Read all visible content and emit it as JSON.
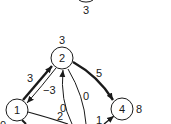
{
  "diagram": {
    "type": "directed-weighted-graph",
    "nodes": [
      {
        "id": "top",
        "label": "",
        "potential": "3"
      },
      {
        "id": "n2",
        "label": "2",
        "potential": "3"
      },
      {
        "id": "n1",
        "label": "1",
        "potential": "0"
      },
      {
        "id": "n4",
        "label": "4",
        "potential": "8"
      }
    ],
    "edges": [
      {
        "from": "1",
        "to": "2",
        "weight": "3",
        "style": "thick"
      },
      {
        "from": "2",
        "to": "1",
        "weight": "-3",
        "style": "thin"
      },
      {
        "from": "2",
        "to": "4",
        "weight": "5",
        "style": "thick"
      },
      {
        "from": "below",
        "to": "2",
        "weight": "0",
        "style": "thin"
      },
      {
        "from": "2",
        "to": "below",
        "weight": "0",
        "style": "thin"
      },
      {
        "from": "1",
        "to": "below",
        "weight": "2",
        "style": "thin"
      },
      {
        "from": "below",
        "to": "4",
        "weight": "1",
        "style": "thin"
      }
    ],
    "display": {
      "top_potential": "3",
      "n2_label": "2",
      "n2_potential": "3",
      "n1_label": "1",
      "n1_potential": "0",
      "n4_label": "4",
      "n4_potential": "8",
      "w_1_2": "3",
      "w_2_1": "−3",
      "w_2_4": "5",
      "w_up_2": "0",
      "w_2_down": "0",
      "w_1_out": "2",
      "w_in_4": "1"
    }
  }
}
